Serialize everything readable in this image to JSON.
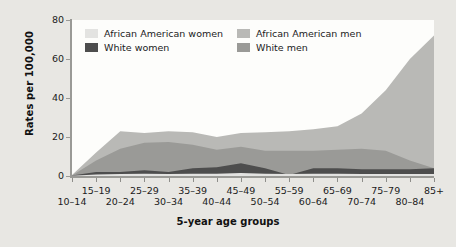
{
  "figure": {
    "background_color": "#e8e7e3",
    "plot_background_color": "#fdfdfb"
  },
  "legend": {
    "position": "top-left-inside",
    "items": [
      {
        "label": "African American women",
        "color": "#e3e3e1"
      },
      {
        "label": "African American men",
        "color": "#b9b9b6"
      },
      {
        "label": "White women",
        "color": "#4d4d4d"
      },
      {
        "label": "White men",
        "color": "#9a9a97"
      }
    ]
  },
  "chart_data": {
    "type": "area",
    "title": "",
    "subtitle": "",
    "xlabel": "5-year age groups",
    "ylabel": "Rates per 100,000",
    "ylim": [
      0,
      80
    ],
    "yticks": [
      0,
      20,
      40,
      60,
      80
    ],
    "grid": false,
    "stacked": false,
    "categories": [
      "10-14",
      "15-19",
      "20-24",
      "25-29",
      "30-34",
      "35-39",
      "40-44",
      "45-49",
      "50-54",
      "55-59",
      "60-64",
      "65-69",
      "70-74",
      "75-79",
      "80-84",
      "85+"
    ],
    "series": [
      {
        "name": "African American men",
        "color": "#b9b9b6",
        "values": [
          0.5,
          12,
          23,
          22,
          23,
          22.5,
          20,
          22,
          22.5,
          23,
          24,
          25.5,
          32,
          44,
          60,
          72
        ]
      },
      {
        "name": "White men",
        "color": "#9a9a97",
        "values": [
          0.3,
          8,
          14,
          17,
          17.5,
          16,
          13.5,
          15,
          13,
          13,
          13,
          13.5,
          14,
          13,
          8,
          4
        ]
      },
      {
        "name": "White women",
        "color": "#4d4d4d",
        "values": [
          0.2,
          2,
          2,
          3,
          2,
          4,
          4.5,
          6.5,
          4,
          0.5,
          4,
          4,
          3.5,
          3.5,
          3.5,
          4
        ]
      },
      {
        "name": "African American women",
        "color": "#e3e3e1",
        "values": [
          0.1,
          0.8,
          1,
          1.2,
          1,
          1.2,
          1.2,
          1.5,
          1.2,
          1,
          1.2,
          1.2,
          1,
          1,
          1,
          1
        ]
      }
    ]
  },
  "x_axis_rows": {
    "bottom_row": [
      "10-14",
      "20-24",
      "30-34",
      "40-44",
      "50-54",
      "60-64",
      "70-74",
      "80-84"
    ],
    "top_row": [
      "15-19",
      "25-29",
      "35-39",
      "45-49",
      "55-59",
      "65-69",
      "75-79",
      "85+"
    ]
  }
}
